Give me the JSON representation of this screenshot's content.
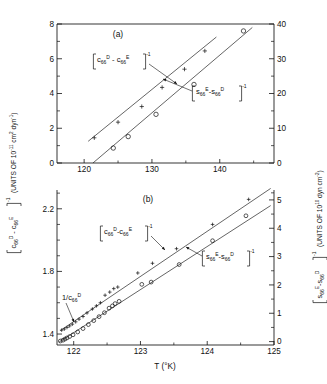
{
  "figure": {
    "xlabel": "T (°K)",
    "panels": [
      {
        "id": "(a)",
        "x_range": [
          116,
          148
        ],
        "x_ticks": [
          120,
          130,
          140
        ],
        "x_tick_labels": [
          "120",
          "130",
          "140"
        ],
        "left_axis": {
          "range": [
            0,
            8
          ],
          "ticks": [
            0,
            2,
            4,
            6,
            8
          ],
          "tick_labels": [
            "0",
            "2",
            "4",
            "6",
            "8"
          ],
          "label_bracket_open": "[",
          "label_main_1": "c",
          "label_sub_1": "66",
          "label_sup_1": "D",
          "label_minus": "-",
          "label_main_2": "c",
          "label_sub_2": "66",
          "label_sup_2": "E",
          "label_bracket_close": "]",
          "label_exp": "-1",
          "label_units": "(UNITS OF 10",
          "label_units_exp": "-11",
          "label_units_tail": "cm",
          "label_units_tail_exp": "2",
          "label_units_tail2": "dyn",
          "label_units_tail2_exp": "-1",
          "label_units_close": ")"
        },
        "right_axis": {
          "range": [
            0,
            40
          ],
          "ticks": [
            0,
            10,
            20,
            30,
            40
          ],
          "tick_labels": [
            "0",
            "10",
            "20",
            "30",
            "40"
          ],
          "label_main_1": "s",
          "label_sub_1": "66",
          "label_sup_1": "E",
          "label_main_2": "s",
          "label_sub_2": "66",
          "label_sup_2": "D",
          "label_units": "(UNITS OF 10",
          "label_units_exp": "10",
          "label_units_tail": "dyn",
          "label_units_tail2": "cm",
          "label_units_tail2_exp": "-2"
        },
        "annotation_c": {
          "open": "[",
          "t1": "c",
          "s1": "66",
          "e1": "D",
          "minus": "-",
          "t2": "c",
          "s2": "66",
          "e2": "E",
          "close": "]",
          "exp": "-1"
        },
        "annotation_s": {
          "open": "[",
          "t1": "s",
          "s1": "66",
          "e1": "E",
          "minus": "-",
          "t2": "s",
          "s2": "66",
          "e2": "D",
          "close": "]",
          "exp": "-1"
        }
      },
      {
        "id": "(b)",
        "x_range": [
          121.75,
          125.0
        ],
        "x_ticks": [
          122,
          123,
          124,
          125
        ],
        "x_tick_labels": [
          "122",
          "123",
          "124",
          "125"
        ],
        "left_axis": {
          "range": [
            1.33,
            2.32
          ],
          "ticks": [
            1.4,
            1.8,
            2.2
          ],
          "tick_labels": [
            "1.4",
            "1.8",
            "2.2"
          ]
        },
        "right_axis": {
          "range": [
            -0.12,
            5.35
          ],
          "ticks": [
            0,
            1,
            2,
            3,
            4,
            5
          ],
          "tick_labels": [
            "0",
            "1",
            "2",
            "3",
            "4",
            "5"
          ]
        },
        "annotation_inv": {
          "pre": "1/c",
          "sub": "66",
          "sup": "D"
        },
        "annotation_c": {
          "open": "[",
          "t1": "c",
          "s1": "66",
          "e1": "D",
          "minus": "-",
          "t2": "c",
          "s2": "66",
          "e2": "E",
          "close": "]",
          "exp": "-1"
        },
        "annotation_s": {
          "open": "[",
          "t1": "s",
          "s1": "66",
          "e1": "E",
          "minus": "-",
          "t2": "s",
          "s2": "66",
          "e2": "D",
          "close": "]",
          "exp": "-1"
        }
      }
    ]
  },
  "chart_data": {
    "type": "scatter",
    "title": "",
    "xlabel": "T (°K)",
    "grid": false,
    "legend": "inline-annotations",
    "panels": [
      {
        "name": "(a)",
        "xlim": [
          116,
          148
        ],
        "xticks": [
          120,
          130,
          140
        ],
        "left_ylabel": "[c66^D - c66^E]^-1 (UNITS OF 10^-11 cm^2 dyn^-1)",
        "left_ylim": [
          0,
          8
        ],
        "left_yticks": [
          0,
          2,
          4,
          6,
          8
        ],
        "right_ylabel": "[s66^E - s66^D]^-1 (UNITS OF 10^10 dyn cm^-2)",
        "right_ylim": [
          0,
          40
        ],
        "right_yticks": [
          0,
          10,
          20,
          30,
          40
        ],
        "series": [
          {
            "name": "[c66^D - c66^E]^-1",
            "marker": "plus",
            "axis": "left",
            "x": [
              121.5,
              125.0,
              128.5,
              131.5,
              134.8,
              137.8
            ],
            "y": [
              1.45,
              2.35,
              3.25,
              4.35,
              5.4,
              6.45
            ]
          },
          {
            "name": "[s66^E - s66^D]^-1",
            "marker": "open-circle",
            "axis": "right",
            "x": [
              124.3,
              126.5,
              130.6,
              136.2,
              143.5
            ],
            "y": [
              4.3,
              7.6,
              14.0,
              22.6,
              38.0
            ]
          }
        ],
        "fit_lines": [
          {
            "series": "[c66^D - c66^E]^-1",
            "x": [
              120.6,
              139.5
            ],
            "y": [
              1.25,
              7.25
            ],
            "axis": "left"
          },
          {
            "series": "[s66^E - s66^D]^-1",
            "x": [
              121.3,
              144.8
            ],
            "y": [
              0.0,
              39.0
            ],
            "axis": "right"
          }
        ]
      },
      {
        "name": "(b)",
        "xlim": [
          121.75,
          125.0
        ],
        "xticks": [
          122,
          123,
          124,
          125
        ],
        "left_ylabel": "[c66^D - c66^E]^-1",
        "left_ylim": [
          1.33,
          2.32
        ],
        "left_yticks": [
          1.4,
          1.8,
          2.2
        ],
        "right_ylabel": "[s66^E - s66^D]^-1",
        "right_ylim": [
          -0.12,
          5.35
        ],
        "right_yticks": [
          0,
          1,
          2,
          3,
          4,
          5
        ],
        "annotations": [
          {
            "text": "1/c66^D",
            "x": 121.95,
            "y": 1.46,
            "axis": "left"
          }
        ],
        "series": [
          {
            "name": "[c66^D - c66^E]^-1",
            "marker": "plus",
            "axis": "left",
            "x": [
              121.82,
              121.86,
              121.9,
              121.94,
              121.98,
              122.03,
              122.08,
              122.14,
              122.2,
              122.28,
              122.34,
              122.4,
              122.47,
              122.54,
              122.6,
              122.66,
              122.96,
              123.18,
              123.54,
              124.08,
              124.62
            ],
            "y": [
              1.425,
              1.432,
              1.442,
              1.452,
              1.463,
              1.478,
              1.495,
              1.512,
              1.535,
              1.56,
              1.58,
              1.6,
              1.648,
              1.668,
              1.69,
              1.7,
              1.79,
              1.852,
              1.945,
              2.1,
              2.26
            ]
          },
          {
            "name": "[s66^E - s66^D]^-1",
            "marker": "open-circle",
            "axis": "right",
            "x": [
              121.8,
              121.84,
              121.87,
              121.9,
              121.94,
              121.99,
              122.06,
              122.14,
              122.22,
              122.3,
              122.38,
              122.46,
              122.53,
              122.58,
              122.62,
              122.68,
              123.02,
              123.16,
              123.58,
              124.08,
              124.58
            ],
            "y": [
              0.02,
              0.05,
              0.09,
              0.13,
              0.18,
              0.24,
              0.34,
              0.46,
              0.6,
              0.74,
              0.88,
              1.02,
              1.18,
              1.26,
              1.34,
              1.42,
              2.02,
              2.1,
              2.72,
              3.56,
              4.44
            ]
          }
        ],
        "fit_lines": [
          {
            "series": "[c66^D - c66^E]^-1",
            "x": [
              121.8,
              124.95
            ],
            "y": [
              1.422,
              2.33
            ],
            "axis": "left"
          },
          {
            "series": "[s66^E - s66^D]^-1",
            "x": [
              121.78,
              124.95
            ],
            "y": [
              -0.02,
              4.8
            ],
            "axis": "right"
          }
        ]
      }
    ]
  }
}
